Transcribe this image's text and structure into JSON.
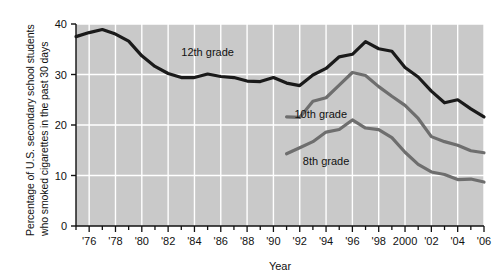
{
  "chart_data": {
    "type": "line",
    "title": "",
    "xlabel": "Year",
    "ylabel": "Percentage of U.S. secondary school students who smoked cigarettes in the past 30 days",
    "ylabel_line1": "Percentage of U.S. secondary school students",
    "ylabel_line2": "who smoked cigarettes in the past 30 days",
    "xlim": [
      1975,
      2006
    ],
    "ylim": [
      0,
      40
    ],
    "yticks": [
      0,
      10,
      20,
      30,
      40
    ],
    "ytick_labels": [
      "0",
      "10",
      "20",
      "30",
      "40"
    ],
    "xticks": [
      1976,
      1978,
      1980,
      1982,
      1984,
      1986,
      1988,
      1990,
      1992,
      1994,
      1996,
      1998,
      2000,
      2002,
      2004,
      2006
    ],
    "xtick_labels": [
      "'76",
      "'78",
      "'80",
      "'82",
      "'84",
      "'86",
      "'88",
      "'90",
      "'92",
      "'94",
      "'96",
      "'98",
      "2000",
      "'02",
      "'04",
      "'06"
    ],
    "xminor_interval": 1,
    "grid": true,
    "grid_color": "#ffffff",
    "plot_background": "#c9c9c9",
    "legend": "inline-annotations",
    "series": [
      {
        "name": "12th grade",
        "color": "#1a1a1a",
        "line_width": 3.2,
        "label_x": 1985.0,
        "label_y": 33.6,
        "x": [
          1975,
          1976,
          1977,
          1978,
          1979,
          1980,
          1981,
          1982,
          1983,
          1984,
          1985,
          1986,
          1987,
          1988,
          1989,
          1990,
          1991,
          1992,
          1993,
          1994,
          1995,
          1996,
          1997,
          1998,
          1999,
          2000,
          2001,
          2002,
          2003,
          2004,
          2005,
          2006
        ],
        "y": [
          37.5,
          38.3,
          38.9,
          38.0,
          36.6,
          33.7,
          31.6,
          30.2,
          29.4,
          29.4,
          30.1,
          29.6,
          29.4,
          28.7,
          28.6,
          29.4,
          28.3,
          27.8,
          29.9,
          31.2,
          33.5,
          34.0,
          36.5,
          35.1,
          34.6,
          31.4,
          29.5,
          26.7,
          24.4,
          25.0,
          23.2,
          21.6
        ]
      },
      {
        "name": "10th grade",
        "color": "#6e6e6e",
        "line_width": 3.2,
        "label_x": 1993.6,
        "label_y": 21.3,
        "x": [
          1991,
          1992,
          1993,
          1994,
          1995,
          1996,
          1997,
          1998,
          1999,
          2000,
          2001,
          2002,
          2003,
          2004,
          2005,
          2006
        ],
        "y": [
          21.6,
          21.5,
          24.7,
          25.4,
          27.9,
          30.4,
          29.8,
          27.6,
          25.7,
          23.9,
          21.3,
          17.7,
          16.7,
          16.0,
          14.9,
          14.5
        ]
      },
      {
        "name": "8th grade",
        "color": "#6e6e6e",
        "line_width": 3.2,
        "label_x": 1994.0,
        "label_y": 12.0,
        "x": [
          1991,
          1992,
          1993,
          1994,
          1995,
          1996,
          1997,
          1998,
          1999,
          2000,
          2001,
          2002,
          2003,
          2004,
          2005,
          2006
        ],
        "y": [
          14.3,
          15.5,
          16.7,
          18.6,
          19.1,
          21.0,
          19.4,
          19.1,
          17.5,
          14.6,
          12.2,
          10.7,
          10.2,
          9.2,
          9.3,
          8.7
        ]
      }
    ]
  }
}
